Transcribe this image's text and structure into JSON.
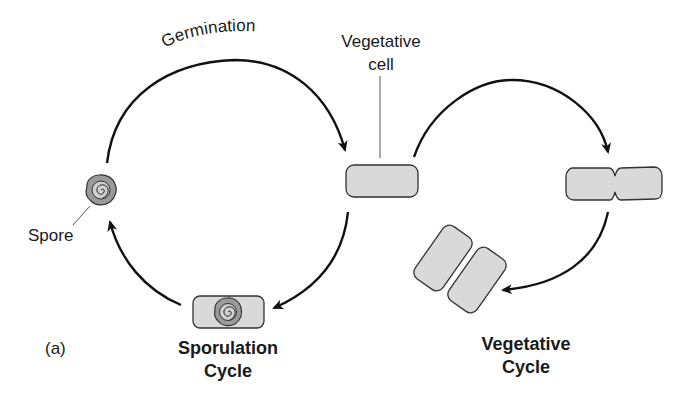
{
  "figure": {
    "panel_label": "(a)",
    "labels": {
      "germination": "Germination",
      "vegetative_cell_line1": "Vegetative",
      "vegetative_cell_line2": "cell",
      "spore": "Spore"
    },
    "cycles": {
      "sporulation": {
        "line1": "Sporulation",
        "line2": "Cycle"
      },
      "vegetative": {
        "line1": "Vegetative",
        "line2": "Cycle"
      }
    },
    "colors": {
      "cell_fill": "#d9d9d9",
      "outline": "#333333",
      "arrow": "#111111",
      "spore_fill": "#9a9a9a"
    }
  }
}
